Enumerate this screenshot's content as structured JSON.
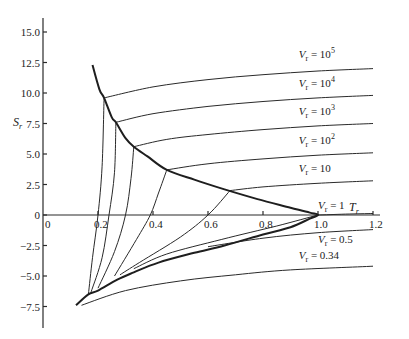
{
  "chart_data": {
    "type": "line",
    "title": "",
    "xlabel": "T_r",
    "ylabel": "S_r",
    "xlim": [
      0,
      1.2
    ],
    "ylim": [
      -9,
      16
    ],
    "grid": false,
    "x_ticks": [
      "0",
      "0.2",
      "0.4",
      "0.6",
      "0.8",
      "1.0",
      "1.2"
    ],
    "y_ticks": [
      "15.0",
      "12.5",
      "10.0",
      "7.5",
      "5.0",
      "2.5",
      "0",
      "-2.5",
      "-5.0",
      "-7.5"
    ],
    "x_tick_values": [
      0,
      0.2,
      0.4,
      0.6,
      0.8,
      1.0,
      1.2
    ],
    "y_tick_values": [
      15.0,
      12.5,
      10.0,
      7.5,
      5.0,
      2.5,
      0,
      -2.5,
      -5.0,
      -7.5
    ],
    "x_title": "T",
    "x_title_sub": "r",
    "y_title": "S",
    "y_title_sub": "r",
    "coexistence_curve": {
      "name": "saturation dome",
      "points": [
        [
          0.18,
          12.3
        ],
        [
          0.205,
          10.3
        ],
        [
          0.222,
          9.6
        ],
        [
          0.25,
          8.0
        ],
        [
          0.265,
          7.6
        ],
        [
          0.3,
          6.3
        ],
        [
          0.33,
          5.6
        ],
        [
          0.38,
          4.8
        ],
        [
          0.45,
          3.7
        ],
        [
          0.55,
          2.9
        ],
        [
          0.66,
          2.1
        ],
        [
          0.78,
          1.3
        ],
        [
          0.9,
          0.6
        ],
        [
          0.97,
          0.2
        ],
        [
          1.0,
          0.0
        ],
        [
          0.97,
          -0.3
        ],
        [
          0.9,
          -1.0
        ],
        [
          0.8,
          -1.6
        ],
        [
          0.66,
          -2.5
        ],
        [
          0.55,
          -3.1
        ],
        [
          0.42,
          -3.9
        ],
        [
          0.33,
          -4.7
        ],
        [
          0.27,
          -5.3
        ],
        [
          0.2,
          -6.2
        ],
        [
          0.165,
          -6.5
        ],
        [
          0.12,
          -7.4
        ]
      ]
    },
    "series": [
      {
        "name": "V_r = 10^5",
        "label": "10",
        "label_sup": "5",
        "points": [
          [
            0.222,
            9.6
          ],
          [
            0.4,
            10.5
          ],
          [
            0.6,
            11.1
          ],
          [
            0.8,
            11.5
          ],
          [
            1.0,
            11.8
          ],
          [
            1.2,
            12.0
          ]
        ],
        "inner_points": [
          [
            0.222,
            9.6
          ],
          [
            0.215,
            4.0
          ],
          [
            0.2,
            0.0
          ],
          [
            0.18,
            -3.5
          ],
          [
            0.165,
            -6.5
          ]
        ]
      },
      {
        "name": "V_r = 10^4",
        "label": "10",
        "label_sup": "4",
        "points": [
          [
            0.265,
            7.6
          ],
          [
            0.4,
            8.3
          ],
          [
            0.6,
            8.9
          ],
          [
            0.8,
            9.3
          ],
          [
            1.0,
            9.6
          ],
          [
            1.2,
            9.8
          ]
        ],
        "inner_points": [
          [
            0.265,
            7.6
          ],
          [
            0.26,
            3.5
          ],
          [
            0.24,
            0.0
          ],
          [
            0.215,
            -3.5
          ],
          [
            0.175,
            -6.3
          ]
        ]
      },
      {
        "name": "V_r = 10^3",
        "label": "10",
        "label_sup": "3",
        "points": [
          [
            0.33,
            5.6
          ],
          [
            0.45,
            6.2
          ],
          [
            0.6,
            6.6
          ],
          [
            0.8,
            7.0
          ],
          [
            1.0,
            7.3
          ],
          [
            1.2,
            7.5
          ]
        ],
        "inner_points": [
          [
            0.33,
            5.6
          ],
          [
            0.32,
            3.0
          ],
          [
            0.3,
            0.0
          ],
          [
            0.26,
            -3.0
          ],
          [
            0.2,
            -6.0
          ]
        ]
      },
      {
        "name": "V_r = 10^2",
        "label": "10",
        "label_sup": "2",
        "points": [
          [
            0.45,
            3.7
          ],
          [
            0.6,
            4.2
          ],
          [
            0.8,
            4.6
          ],
          [
            1.0,
            4.9
          ],
          [
            1.2,
            5.1
          ]
        ],
        "inner_points": [
          [
            0.45,
            3.7
          ],
          [
            0.42,
            1.8
          ],
          [
            0.39,
            0.0
          ],
          [
            0.34,
            -2.0
          ],
          [
            0.26,
            -5.0
          ]
        ]
      },
      {
        "name": "V_r = 10",
        "label": "10",
        "label_sup": "",
        "points": [
          [
            0.68,
            2.0
          ],
          [
            0.8,
            2.3
          ],
          [
            1.0,
            2.6
          ],
          [
            1.2,
            2.8
          ]
        ],
        "inner_points": [
          [
            0.68,
            2.0
          ],
          [
            0.6,
            0.0
          ],
          [
            0.5,
            -1.8
          ],
          [
            0.35,
            -3.9
          ],
          [
            0.28,
            -4.9
          ]
        ]
      },
      {
        "name": "V_r = 1",
        "label": "1",
        "label_sup": "",
        "points": [
          [
            1.0,
            0.0
          ],
          [
            1.1,
            0.07
          ],
          [
            1.2,
            0.12
          ]
        ],
        "inner_points": [
          [
            1.0,
            0.0
          ],
          [
            0.85,
            -0.9
          ],
          [
            0.65,
            -2.0
          ],
          [
            0.45,
            -3.2
          ],
          [
            0.33,
            -4.4
          ]
        ]
      },
      {
        "name": "V_r = 0.5",
        "label": "0.5",
        "label_sup": "",
        "points": [
          [
            0.6,
            -2.6
          ],
          [
            0.8,
            -1.9
          ],
          [
            1.0,
            -1.45
          ],
          [
            1.2,
            -1.2
          ]
        ],
        "inner_points": []
      },
      {
        "name": "V_r = 0.34",
        "label": "0.34",
        "label_sup": "",
        "points": [
          [
            0.14,
            -7.4
          ],
          [
            0.3,
            -6.2
          ],
          [
            0.5,
            -5.4
          ],
          [
            0.7,
            -4.9
          ],
          [
            0.9,
            -4.5
          ],
          [
            1.2,
            -4.2
          ]
        ],
        "inner_points": []
      }
    ],
    "annotations": [
      {
        "text_prefix": "V",
        "sub": "r",
        "eq": " = ",
        "value": "10",
        "sup": "5",
        "x": 0.93,
        "y": 12.9
      },
      {
        "text_prefix": "V",
        "sub": "r",
        "eq": " = ",
        "value": "10",
        "sup": "4",
        "x": 0.93,
        "y": 10.5
      },
      {
        "text_prefix": "V",
        "sub": "r",
        "eq": " = ",
        "value": "10",
        "sup": "3",
        "x": 0.93,
        "y": 8.2
      },
      {
        "text_prefix": "V",
        "sub": "r",
        "eq": " = ",
        "value": "10",
        "sup": "2",
        "x": 0.93,
        "y": 5.8
      },
      {
        "text_prefix": "V",
        "sub": "r",
        "eq": " = ",
        "value": "10",
        "sup": "",
        "x": 0.93,
        "y": 3.5
      },
      {
        "text_prefix": "V",
        "sub": "r",
        "eq": " = ",
        "value": "1",
        "sup": "",
        "x": 1.0,
        "y": 0.5
      },
      {
        "text_prefix": "V",
        "sub": "r",
        "eq": " = ",
        "value": "0.5",
        "sup": "",
        "x": 1.0,
        "y": -2.3
      },
      {
        "text_prefix": "V",
        "sub": "r",
        "eq": " = ",
        "value": "0.34",
        "sup": "",
        "x": 0.93,
        "y": -3.6
      }
    ]
  }
}
